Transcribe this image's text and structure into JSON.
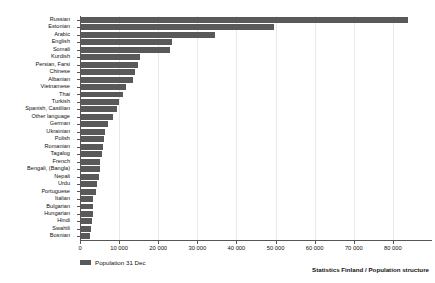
{
  "chart_data": {
    "type": "bar",
    "orientation": "horizontal",
    "title": "",
    "subtitle": "",
    "xlabel": "",
    "ylabel": "",
    "xlim": [
      0,
      90000
    ],
    "ylim": null,
    "grid": true,
    "legend_position": "bottom-left",
    "categories": [
      "Russian",
      "Estonian",
      "Arabic",
      "English",
      "Somali",
      "Kurdish",
      "Persian, Farsi",
      "Chinese",
      "Albanian",
      "Vietnamese",
      "Thai",
      "Turkish",
      "Spanish, Castilian",
      "Other language",
      "German",
      "Ukrainian",
      "Polish",
      "Romanian",
      "Tagalog",
      "French",
      "Bengali, (Bangla)",
      "Nepali",
      "Urdu",
      "Portuguese",
      "Italian",
      "Bulgarian",
      "Hungarian",
      "Hindi",
      "Swahili",
      "Bosnian"
    ],
    "series": [
      {
        "name": "Population 31 Dec",
        "color": "#595959",
        "values": [
          83900,
          49600,
          34500,
          23500,
          23000,
          15300,
          14800,
          14000,
          13600,
          11800,
          11000,
          10000,
          9500,
          8400,
          7200,
          6400,
          6200,
          6000,
          5700,
          5200,
          5000,
          4800,
          4400,
          4000,
          3400,
          3300,
          3200,
          3000,
          2700,
          2500
        ]
      }
    ],
    "xticks": [
      0,
      10000,
      20000,
      30000,
      40000,
      50000,
      60000,
      70000,
      80000
    ],
    "xticklabels": [
      "0",
      "10 000",
      "20 000",
      "30 000",
      "40 000",
      "50 000",
      "60 000",
      "70 000",
      "80 000"
    ]
  },
  "legend": {
    "entries": [
      {
        "label": "Population 31 Dec",
        "color": "#595959"
      }
    ]
  },
  "footer": {
    "source": "Statistics Finland / Population structure"
  },
  "colors": {
    "bar": "#595959",
    "grid": "#e9e9e9",
    "axis": "#555555",
    "text": "#111111",
    "background": "#ffffff"
  }
}
